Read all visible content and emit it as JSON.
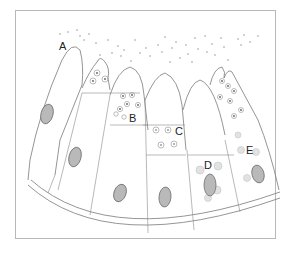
{
  "figure": {
    "labels": [
      {
        "id": "A",
        "text": "A",
        "x": 59,
        "y": 50
      },
      {
        "id": "B",
        "text": "B",
        "x": 131,
        "y": 122
      },
      {
        "id": "C",
        "text": "C",
        "x": 154,
        "y": 133
      },
      {
        "id": "D",
        "text": "D",
        "x": 203,
        "y": 170
      },
      {
        "id": "E",
        "text": "E",
        "x": 247,
        "y": 154
      }
    ],
    "colors": {
      "frame": "#b8b8b8",
      "line": "#7a7a7a",
      "nucleus": "#b9b9b9",
      "label": "#222222"
    }
  }
}
